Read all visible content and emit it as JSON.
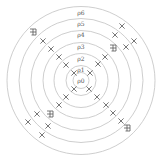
{
  "diagram": {
    "type": "concentric-rings",
    "center": {
      "x": 81,
      "y": 80.5
    },
    "ring_color": "#c8c8c8",
    "mark_color": "#555555",
    "rings": [
      {
        "label": "ρ0",
        "radius": 8,
        "label_y": 81
      },
      {
        "label": "ρ1",
        "radius": 15,
        "label_y": 70
      },
      {
        "label": "ρ2",
        "radius": 27,
        "label_y": 59
      },
      {
        "label": "ρ3",
        "radius": 38,
        "label_y": 47
      },
      {
        "label": "ρ4",
        "radius": 50,
        "label_y": 35
      },
      {
        "label": "ρ5",
        "radius": 62,
        "label_y": 24
      },
      {
        "label": "ρ6",
        "radius": 74,
        "label_y": 13
      }
    ],
    "x_marks": [
      {
        "x": 74,
        "y": 73
      },
      {
        "x": 66,
        "y": 65
      },
      {
        "x": 59,
        "y": 57
      },
      {
        "x": 51,
        "y": 49
      },
      {
        "x": 43,
        "y": 41
      },
      {
        "x": 90,
        "y": 73
      },
      {
        "x": 98,
        "y": 64
      },
      {
        "x": 105,
        "y": 57
      },
      {
        "x": 126,
        "y": 47
      },
      {
        "x": 115,
        "y": 35
      },
      {
        "x": 134,
        "y": 41
      },
      {
        "x": 122,
        "y": 26
      },
      {
        "x": 74,
        "y": 89
      },
      {
        "x": 66,
        "y": 97
      },
      {
        "x": 59,
        "y": 105
      },
      {
        "x": 37,
        "y": 114
      },
      {
        "x": 28,
        "y": 122
      },
      {
        "x": 48,
        "y": 126
      },
      {
        "x": 42,
        "y": 135
      },
      {
        "x": 89,
        "y": 89
      },
      {
        "x": 97,
        "y": 97
      },
      {
        "x": 106,
        "y": 105
      },
      {
        "x": 113,
        "y": 113
      },
      {
        "x": 121,
        "y": 121
      }
    ],
    "hatch_marks": [
      {
        "x": 33,
        "y": 32
      },
      {
        "x": 113,
        "y": 48
      },
      {
        "x": 50,
        "y": 114
      },
      {
        "x": 127,
        "y": 128
      }
    ]
  }
}
